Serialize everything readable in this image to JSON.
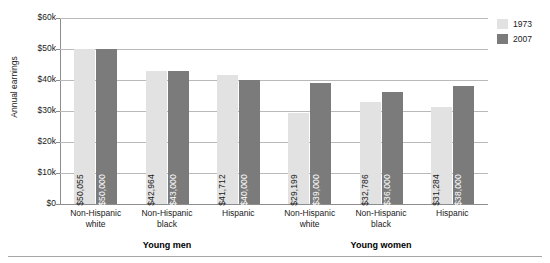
{
  "chart_data": {
    "type": "bar",
    "title": "",
    "xlabel": "",
    "ylabel": "Annual earnings",
    "ylim": [
      0,
      60000
    ],
    "yticks": [
      0,
      10000,
      20000,
      30000,
      40000,
      50000,
      60000
    ],
    "ytick_labels": [
      "$0",
      "$10k",
      "$20k",
      "$30k",
      "$40k",
      "$50k",
      "$60k"
    ],
    "grid": true,
    "legend_position": "top-right",
    "categories": [
      "Non-Hispanic white",
      "Non-Hispanic black",
      "Hispanic",
      "Non-Hispanic white",
      "Non-Hispanic black",
      "Hispanic"
    ],
    "groups": [
      {
        "label": "Young men",
        "categories": [
          0,
          1,
          2
        ]
      },
      {
        "label": "Young women",
        "categories": [
          3,
          4,
          5
        ]
      }
    ],
    "series": [
      {
        "name": "1973",
        "color": "#e2e2e2",
        "values": [
          50055,
          42964,
          41712,
          29199,
          32786,
          31284
        ],
        "labels": [
          "$50,055",
          "$42,964",
          "$41,712",
          "$29,199",
          "$32,786",
          "$31,284"
        ]
      },
      {
        "name": "2007",
        "color": "#7b7b7b",
        "values": [
          50000,
          43000,
          40000,
          39000,
          36000,
          38000
        ],
        "labels": [
          "$50,000",
          "$43,000",
          "$40,000",
          "$39,000",
          "$36,000",
          "$38,000"
        ]
      }
    ]
  },
  "legend": {
    "items": [
      {
        "label": "1973",
        "color": "#e2e2e2"
      },
      {
        "label": "2007",
        "color": "#7b7b7b"
      }
    ]
  },
  "axis": {
    "y_title": "Annual earnings"
  }
}
